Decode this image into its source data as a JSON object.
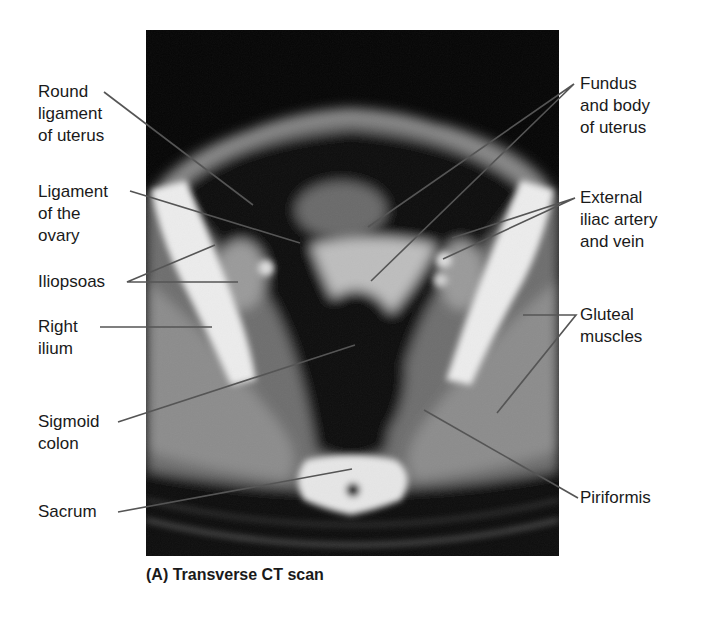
{
  "figure": {
    "caption": "(A) Transverse CT scan",
    "image_type": "transverse CT scan of female pelvis"
  },
  "labels_left": [
    {
      "id": "round-ligament",
      "text": "Round\nligament\nof uterus"
    },
    {
      "id": "ligament-ovary",
      "text": "Ligament\nof the\novary"
    },
    {
      "id": "iliopsoas",
      "text": "Iliopsoas"
    },
    {
      "id": "right-ilium",
      "text": "Right\nilium"
    },
    {
      "id": "sigmoid-colon",
      "text": "Sigmoid\ncolon"
    },
    {
      "id": "sacrum",
      "text": "Sacrum"
    }
  ],
  "labels_right": [
    {
      "id": "fundus-body-uterus",
      "text": "Fundus\nand body\nof uterus"
    },
    {
      "id": "external-iliac",
      "text": "External\niliac artery\nand vein"
    },
    {
      "id": "gluteal-muscles",
      "text": "Gluteal\nmuscles"
    },
    {
      "id": "piriformis",
      "text": "Piriformis"
    }
  ],
  "colors": {
    "background": "#ffffff",
    "scan_black": "#050505",
    "leader_line": "#555555",
    "text": "#1a1a1a"
  }
}
